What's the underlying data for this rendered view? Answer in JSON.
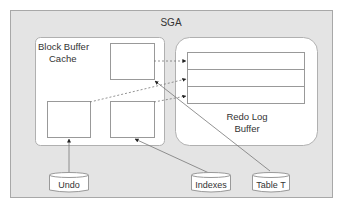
{
  "diagram": {
    "sga": {
      "label": "SGA",
      "fill": "#e4e4e4",
      "stroke": "#a8a8a8"
    },
    "block_buffer_cache": {
      "label_line1": "Block Buffer",
      "label_line2": "Cache",
      "blocks": [
        "top-block",
        "left-block",
        "middle-block"
      ]
    },
    "redo_log_buffer": {
      "label_line1": "Redo Log",
      "label_line2": "Buffer",
      "entries": 3
    },
    "data_sources": [
      {
        "id": "undo",
        "label": "Undo"
      },
      {
        "id": "indexes",
        "label": "Indexes"
      },
      {
        "id": "table_t",
        "label": "Table T"
      }
    ],
    "connections": [
      {
        "from": "undo",
        "to": "left-block",
        "style": "solid"
      },
      {
        "from": "indexes",
        "to": "middle-block",
        "style": "solid"
      },
      {
        "from": "table_t",
        "to": "top-block",
        "style": "solid"
      },
      {
        "from": "top-block",
        "to": "redo-entry-1",
        "style": "dashed"
      },
      {
        "from": "left-block",
        "to": "redo-entry-2",
        "style": "dashed"
      },
      {
        "from": "middle-block",
        "to": "redo-entry-3",
        "style": "dashed"
      }
    ]
  }
}
